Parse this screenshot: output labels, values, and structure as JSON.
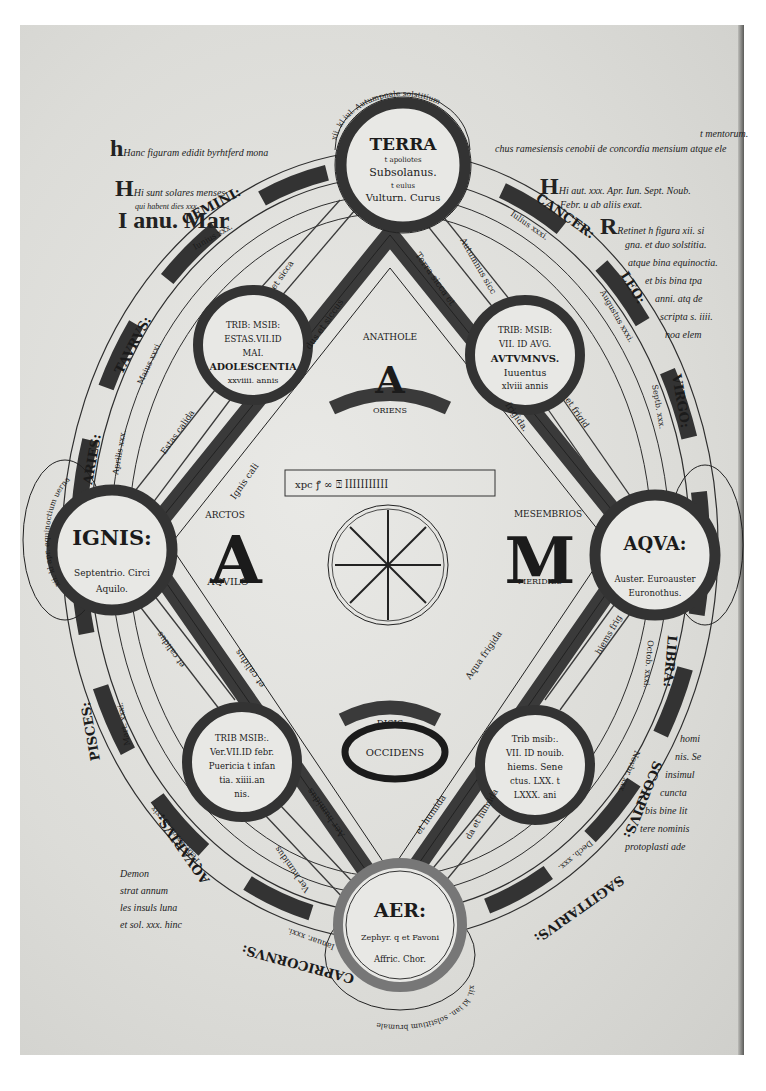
{
  "figure": {
    "type": "manuscript-diagram",
    "title_gloss": "Hanc figuram edidit byrhtferd monachus ramesiensis cenobii de concordia mensium atque elementorum",
    "colors": {
      "ink": "#1b1b1b",
      "band": "#3a3a3a",
      "vellum": "#e4e4e0",
      "frame": "#ffffff"
    }
  },
  "elements": {
    "terra": {
      "name": "TERRA",
      "lines": [
        "t apoliotes",
        "Subsolanus.",
        "t eulus",
        "Vulturn. Curus"
      ]
    },
    "ignis": {
      "name": "IGNIS:",
      "lines": [
        "Septentrio. Circi",
        "Aquilo."
      ]
    },
    "aqua": {
      "name": "AQVA:",
      "lines": [
        "Auster. Euroauster",
        "Euronothus."
      ]
    },
    "aer": {
      "name": "AER:",
      "lines": [
        "Zephyr. q et Favoni",
        "Affric. Chor."
      ]
    }
  },
  "seasons": {
    "summer": {
      "lines": [
        "TRIB: MSIB:",
        "ESTAS.VII.ID",
        "MAI.",
        "ADOLESCENTIA",
        "xxviiii. annis"
      ]
    },
    "autumn": {
      "lines": [
        "TRIB: MSIB:",
        "VII. ID AVG.",
        "AVTVMNVS.",
        "Iuuentus",
        "xlviii annis"
      ]
    },
    "spring": {
      "lines": [
        "TRIB MSIB:.",
        "Ver.VII.ID febr.",
        "Puericia t infan",
        "tia. xiiii.an",
        "nis."
      ]
    },
    "winter": {
      "lines": [
        "Trib msib:.",
        "VII. ID nouib.",
        "hiems. Sene",
        "ctus. LXX. t",
        "LXXX. ani"
      ]
    }
  },
  "adam": {
    "top": {
      "label": "ANATHOLE",
      "letter": "A",
      "band": "ORIENS"
    },
    "left": {
      "label": "ARCTOS",
      "letter": "A",
      "sub": "AQVILO"
    },
    "right": {
      "label": "MESEMBRIOS",
      "letter": "M",
      "sub": "MERIDIES"
    },
    "bottom": {
      "label": "DISIS",
      "letter": "O",
      "sub": "OCCIDENS"
    }
  },
  "diamond_labels": [
    "Terra sicca et",
    "frigida.",
    "Aqua frigida",
    "et humida",
    "Aer humidus",
    "et calidus",
    "Ignis cali",
    "dus et siccus"
  ],
  "spokes": [
    "et sicca",
    "Autumnus sicc",
    "Estas calida",
    "et frigid",
    "hiems frig",
    "et calidus",
    "Ver humidus",
    "da et humida"
  ],
  "zodiac": [
    {
      "sign": "GEMINI:",
      "month": "Iunius xxx.",
      "days": "Lv. xxx."
    },
    {
      "sign": "CANCER:",
      "month": "Iulius xxxi.",
      "days": "Lv. xxix."
    },
    {
      "sign": "LEO:",
      "month": "Augustus xxxi.",
      "days": "Lv. xxx."
    },
    {
      "sign": "VIRGO:",
      "month": "Septb. xxx.",
      "days": "Lv. xxix."
    },
    {
      "sign": "LIBRA:",
      "month": "Octob. xxxi.",
      "days": "Lv. xxx."
    },
    {
      "sign": "SCORPIVS:",
      "month": "Novbr. xxx.",
      "days": "Lv. xxix."
    },
    {
      "sign": "SAGITTARIVS:",
      "month": "Decb. xxx.",
      "days": "Lv. xxix."
    },
    {
      "sign": "CAPRICORNVS:",
      "month": "Ianuar. xxxi.",
      "days": "Lv. xxx."
    },
    {
      "sign": "AQVARIVS:",
      "month": "Febr. xxviii. t xxix",
      "days": "Lv. xxix."
    },
    {
      "sign": "PISCES:",
      "month": "Mart. xxxi.",
      "days": "Lv. xxx."
    },
    {
      "sign": "ARIES:",
      "month": "Aprilis xxx.",
      "days": "Lv. xxix."
    },
    {
      "sign": "TAVRVS:",
      "month": "Maius xxxi.",
      "days": "Lv. xxx."
    }
  ],
  "outer_arcs": {
    "top": "xii. kl iul. Autumpnale solstitium",
    "left": "xii. kl apr. equinoctium uernale",
    "right": "xii. kl oct. equinoctium",
    "bottom": "xii. kl ian. solstitium brumale"
  },
  "margins": {
    "top_left": "Hanc figuram edidit byrhtferd mona",
    "top_right": "chus ramesiensis cenobii de concordia mensium atque ele",
    "top_right_sup": "t mentorum.",
    "left_H": "Hi sunt solares menses",
    "left_H2": "qui habent dies xxx.",
    "left_I": [
      "I anu. Mar",
      "Mai.",
      "Iul.",
      "Aug.",
      "Octb.",
      "Decb."
    ],
    "right_H": "Hi aut. xxx. Apr. Iun. Sept. Noub.",
    "right_H2": "Febr. u ab aliis exat.",
    "right_R": [
      "Retinet h figura xii. si",
      "gna. et duo solstitia.",
      "atque bina equinoctia.",
      "et bis bina tpa",
      "anni. atq de",
      "scripta s. iiii.",
      "noa elem",
      "torum. et",
      "duode",
      "nos",
      "men",
      "ses",
      "mona",
      "ach. in.",
      "etc."
    ],
    "bottom_right": [
      "homi",
      "nis. Se",
      "insimul",
      "cuncta",
      "bis bine lit",
      "tere nominis",
      "protoplasti ade"
    ],
    "bottom_left": [
      "Demon",
      "strat annum",
      "les insuls luna",
      "et sol. xxx. hinc"
    ]
  },
  "center": {
    "cipher_row": "xpc ... cipher notation",
    "wheel": "eight-spoke numeral wheel"
  }
}
